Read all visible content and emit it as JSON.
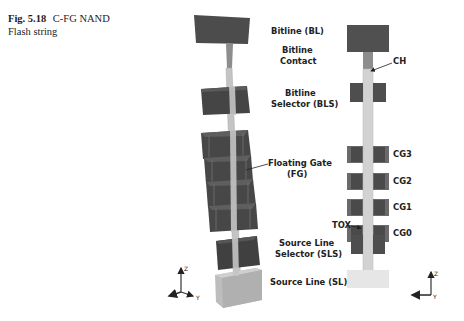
{
  "caption": {
    "figure_number": "Fig. 5.18",
    "title_line1": "C-FG NAND",
    "title_line2": "Flash string"
  },
  "labels_3d": {
    "bitline": "Bitline (BL)",
    "bitline_contact_1": "Bitline",
    "bitline_contact_2": "Contact",
    "bls_1": "Bitline",
    "bls_2": "Selector (BLS)",
    "fg_1": "Floating Gate",
    "fg_2": "(FG)",
    "sls_1": "Source Line",
    "sls_2": "Selector (SLS)",
    "sl": "Source Line (SL)"
  },
  "labels_cross_section": {
    "ch": "CH",
    "cg3": "CG3",
    "cg2": "CG2",
    "cg1": "CG1",
    "cg0": "CG0",
    "tox": "TOX"
  },
  "axes": {
    "left": {
      "z": "Z",
      "y": "Y"
    },
    "right": {
      "z": "Z",
      "y": "Y",
      "x": "X"
    }
  },
  "colors": {
    "dark_block": "#4a4a4a",
    "dark_block_edge": "#3a3a3a",
    "channel": "#c8c8c8",
    "contact": "#8a8a8a",
    "source_line": "#bdbdbd",
    "source_line_cross": "#e6e6e6"
  }
}
